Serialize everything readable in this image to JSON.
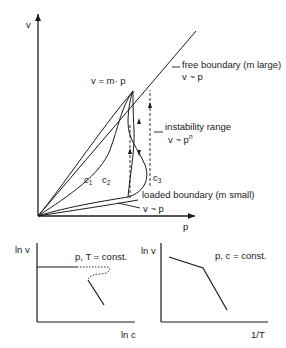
{
  "main_plot": {
    "y_axis_label": "v",
    "x_axis_label": "p",
    "line_label": "v = m· p",
    "free_boundary": {
      "label": "free boundary (m  large)",
      "relation": "v ~ p"
    },
    "instability": {
      "label": "instability range",
      "relation_base": "v ~ p",
      "relation_exp": "n"
    },
    "loaded_boundary": {
      "label": "loaded boundary  (m small)",
      "relation": "v ~ p"
    },
    "curves": [
      {
        "name": "c",
        "sub": "1"
      },
      {
        "name": "c",
        "sub": "2"
      },
      {
        "name": "c",
        "sub": "3"
      }
    ]
  },
  "bottom_left_plot": {
    "y_axis_label": "ln v",
    "x_axis_label": "ln c",
    "condition": "p, T = const."
  },
  "bottom_right_plot": {
    "y_axis_label": "ln v",
    "x_axis_label": "1/T",
    "condition": "p, c = const."
  },
  "colors": {
    "ink": "#1a1a1a",
    "background": "#ffffff"
  }
}
